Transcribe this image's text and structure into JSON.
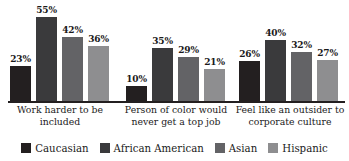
{
  "chart_data": {
    "type": "bar",
    "title": "",
    "subtitle": "",
    "xlabel": "",
    "ylabel": "",
    "ylim": [
      0,
      60
    ],
    "grid": false,
    "legend_position": "bottom",
    "value_suffix": "%",
    "categories": [
      "Work harder to be included",
      "Person of color would never get a top job",
      "Feel like an outsider to corporate culture"
    ],
    "category_lines": [
      [
        "Work harder to be",
        "included"
      ],
      [
        "Person of color would",
        "never get a top job"
      ],
      [
        "Feel like an outsider to",
        "corporate culture"
      ]
    ],
    "series": [
      {
        "name": "Caucasian",
        "color": "#231f20",
        "values": [
          23,
          10,
          26
        ],
        "labels": [
          "23%",
          "10%",
          "26%"
        ]
      },
      {
        "name": "African American",
        "color": "#3a3a3c",
        "values": [
          55,
          35,
          40
        ],
        "labels": [
          "55%",
          "35%",
          "40%"
        ]
      },
      {
        "name": "Asian",
        "color": "#636366",
        "values": [
          42,
          29,
          32
        ],
        "labels": [
          "42%",
          "29%",
          "32%"
        ]
      },
      {
        "name": "Hispanic",
        "color": "#8e8e90",
        "values": [
          36,
          21,
          27
        ],
        "labels": [
          "36%",
          "21%",
          "27%"
        ]
      }
    ]
  },
  "legend": {
    "items": [
      {
        "label": "Caucasian",
        "color": "#231f20"
      },
      {
        "label": "African American",
        "color": "#3a3a3c"
      },
      {
        "label": "Asian",
        "color": "#636366"
      },
      {
        "label": "Hispanic",
        "color": "#8e8e90"
      }
    ]
  }
}
